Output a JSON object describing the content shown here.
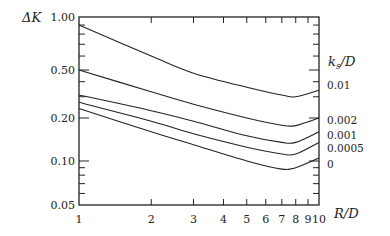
{
  "chart_data": {
    "type": "line",
    "title": "",
    "xlabel": "R/D",
    "ylabel": "ΔK",
    "xscale": "log",
    "yscale": "log",
    "xlim": [
      1,
      10
    ],
    "ylim": [
      0.05,
      1.0
    ],
    "grid": false,
    "legend_title": "k_s/D",
    "legend_position": "right, inline labels at curve ends",
    "x_ticks": [
      "1",
      "2",
      "3",
      "4",
      "5",
      "6",
      "7",
      "8",
      "9",
      "10"
    ],
    "y_ticks": [
      "0.05",
      "0.10",
      "0.20",
      "0.50",
      "1.00"
    ],
    "x": [
      1,
      2,
      3,
      5,
      7,
      8,
      10
    ],
    "series": [
      {
        "name": "0.01",
        "values": [
          0.9,
          0.6,
          0.47,
          0.36,
          0.31,
          0.3,
          0.34
        ]
      },
      {
        "name": "0.002",
        "values": [
          0.5,
          0.33,
          0.26,
          0.2,
          0.178,
          0.177,
          0.2
        ]
      },
      {
        "name": "0.001",
        "values": [
          0.31,
          0.23,
          0.19,
          0.15,
          0.135,
          0.135,
          0.16
        ]
      },
      {
        "name": "0.0005",
        "values": [
          0.27,
          0.19,
          0.155,
          0.125,
          0.112,
          0.112,
          0.135
        ]
      },
      {
        "name": "0",
        "values": [
          0.24,
          0.16,
          0.13,
          0.1,
          0.088,
          0.09,
          0.105
        ]
      }
    ]
  },
  "labels": {
    "y_axis_title": "ΔK",
    "x_axis_title": "R/D",
    "legend_title_k": "k",
    "legend_title_sub": "s",
    "legend_title_rest": "/D"
  }
}
